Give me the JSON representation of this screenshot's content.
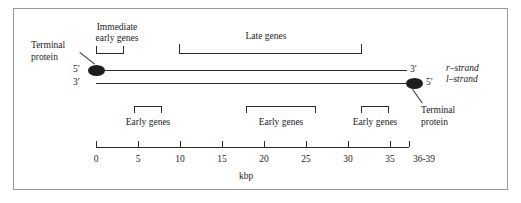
{
  "figure": {
    "axis_title": "kbp",
    "strand_labels": {
      "r_strand": "r–strand",
      "l_strand": "l–strand"
    },
    "end_labels": {
      "left_top": "5′",
      "left_bottom": "3′",
      "right_top": "3′",
      "right_bottom": "5′"
    },
    "terminal_protein_left": {
      "line1": "Terminal",
      "line2": "protein"
    },
    "terminal_protein_right": {
      "line1": "Terminal",
      "line2": "protein"
    },
    "gene_regions": [
      {
        "id": "immediate-early",
        "line1": "Immediate",
        "line2": "early genes",
        "start_kbp": 0,
        "end_kbp": 3.2
      },
      {
        "id": "late",
        "label": "Late genes",
        "start_kbp": 10,
        "end_kbp": 31.8
      },
      {
        "id": "early-1",
        "label": "Early genes",
        "start_kbp": 4.6,
        "end_kbp": 7.9
      },
      {
        "id": "early-2",
        "label": "Early genes",
        "start_kbp": 18.2,
        "end_kbp": 26.6
      },
      {
        "id": "early-3",
        "label": "Early genes",
        "start_kbp": 31.8,
        "end_kbp": 35.2
      }
    ],
    "axis_ticks": [
      {
        "label": "0",
        "kbp": 0
      },
      {
        "label": "5",
        "kbp": 5
      },
      {
        "label": "10",
        "kbp": 10
      },
      {
        "label": "15",
        "kbp": 15
      },
      {
        "label": "20",
        "kbp": 20
      },
      {
        "label": "25",
        "kbp": 25
      },
      {
        "label": "30",
        "kbp": 30
      },
      {
        "label": "35",
        "kbp": 35
      },
      {
        "label": "36-39",
        "kbp": 37.5
      }
    ],
    "colors": {
      "ink": "#1d1d1d",
      "frame": "#9a9a9a",
      "background": "#ffffff"
    }
  }
}
